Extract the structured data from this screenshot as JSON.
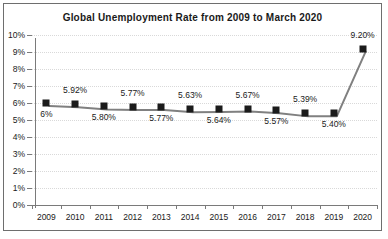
{
  "chart_data": {
    "type": "line",
    "title": "Global Unemployment Rate from 2009 to March 2020",
    "xlabel": "",
    "ylabel": "",
    "categories": [
      "2009",
      "2010",
      "2011",
      "2012",
      "2013",
      "2014",
      "2015",
      "2016",
      "2017",
      "2018",
      "2019",
      "2020"
    ],
    "values": [
      6.0,
      5.92,
      5.8,
      5.77,
      5.77,
      5.63,
      5.64,
      5.67,
      5.57,
      5.39,
      5.4,
      9.2
    ],
    "point_labels": [
      "6%",
      "5.92%",
      "5.80%",
      "5.77%",
      "5.77%",
      "5.63%",
      "5.64%",
      "5.67%",
      "5.57%",
      "5.39%",
      "5.40%",
      "9.20%"
    ],
    "label_positions": [
      "below",
      "above",
      "below",
      "above",
      "below",
      "above",
      "below",
      "above",
      "below",
      "above",
      "below",
      "above"
    ],
    "ylim": [
      0,
      10
    ],
    "ytick_values": [
      0,
      1,
      2,
      3,
      4,
      5,
      6,
      7,
      8,
      9,
      10
    ],
    "ytick_labels": [
      "0%",
      "1%",
      "2%",
      "3%",
      "4%",
      "5%",
      "6%",
      "7%",
      "8%",
      "9%",
      "10%"
    ],
    "grid": true,
    "legend": false,
    "series_color": "#808080",
    "marker_color": "#1b1b1b",
    "grid_color": "#d9d9d9",
    "axis_color": "#7a7a7a"
  }
}
